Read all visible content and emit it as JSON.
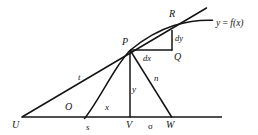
{
  "figure": {
    "kind": "geometry-diagram",
    "colors": {
      "stroke": "#141414",
      "background": "#ffffff",
      "label": "#141414"
    },
    "labels": {
      "point_U": "U",
      "point_O": "O",
      "point_V": "V",
      "point_W": "W",
      "point_P": "P",
      "point_Q": "Q",
      "point_R": "R",
      "segment_t": "t",
      "segment_s": "s",
      "segment_x": "x",
      "segment_y": "y",
      "segment_n": "n",
      "segment_sigma": "σ",
      "differential_dx": "dx",
      "differential_dy": "dy",
      "function_label": "y = f(x)",
      "function_label_y": "y",
      "function_label_eq": " = ",
      "function_label_f": "f",
      "function_label_arg": "(x)"
    },
    "geometry": {
      "baseline": {
        "x1": 22,
        "y1": 117,
        "x2": 222,
        "y2": 117
      },
      "point_U": {
        "x": 22,
        "y": 117
      },
      "point_O": {
        "x": 85,
        "y": 117
      },
      "point_V": {
        "x": 130,
        "y": 117
      },
      "point_W": {
        "x": 172,
        "y": 117
      },
      "point_P": {
        "x": 130,
        "y": 50
      },
      "point_Q": {
        "x": 172,
        "y": 50
      },
      "point_R": {
        "x": 172,
        "y": 31
      },
      "tangent_end": {
        "x": 206,
        "y": 35
      },
      "curve_end": {
        "x": 213,
        "y": 22
      }
    }
  }
}
